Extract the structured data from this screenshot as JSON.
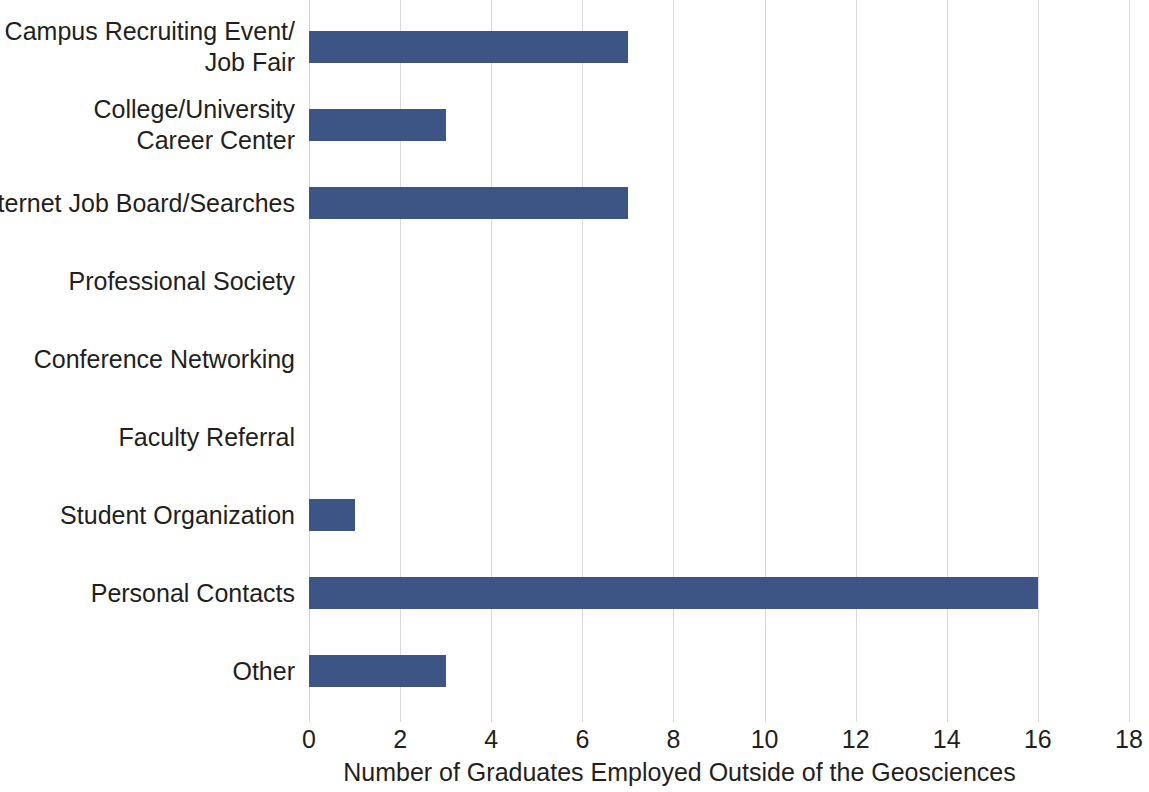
{
  "chart_data": {
    "type": "bar",
    "orientation": "horizontal",
    "title": "",
    "xlabel": "Number of Graduates Employed Outside of the Geosciences",
    "ylabel": "",
    "xlim": [
      0,
      18
    ],
    "xticks": [
      0,
      2,
      4,
      6,
      8,
      10,
      12,
      14,
      16,
      18
    ],
    "xtick_labels": [
      "0",
      "2",
      "4",
      "6",
      "8",
      "10",
      "12",
      "14",
      "16",
      "18"
    ],
    "grid": "vertical",
    "legend": "none",
    "bar_color": "#3d5584",
    "gridline_color": "#d9d9d9",
    "text_color": "#231f20",
    "categories": [
      "Campus Recruiting Event/\nJob Fair",
      "College/University\nCareer Center",
      "Internet Job Board/Searches",
      "Professional Society",
      "Conference Networking",
      "Faculty Referral",
      "Student Organization",
      "Personal Contacts",
      "Other"
    ],
    "values": [
      7,
      3,
      7,
      0,
      0,
      0,
      1,
      16,
      3
    ],
    "bars": [
      {
        "label_line1": "Campus Recruiting Event/",
        "label_line2": "Job Fair",
        "value": 7
      },
      {
        "label_line1": "College/University",
        "label_line2": "Career Center",
        "value": 3
      },
      {
        "label_line1": "Internet Job Board/Searches",
        "label_line2": "",
        "value": 7
      },
      {
        "label_line1": "Professional Society",
        "label_line2": "",
        "value": 0
      },
      {
        "label_line1": "Conference Networking",
        "label_line2": "",
        "value": 0
      },
      {
        "label_line1": "Faculty Referral",
        "label_line2": "",
        "value": 0
      },
      {
        "label_line1": "Student Organization",
        "label_line2": "",
        "value": 1
      },
      {
        "label_line1": "Personal Contacts",
        "label_line2": "",
        "value": 16
      },
      {
        "label_line1": "Other",
        "label_line2": "",
        "value": 3
      }
    ]
  }
}
